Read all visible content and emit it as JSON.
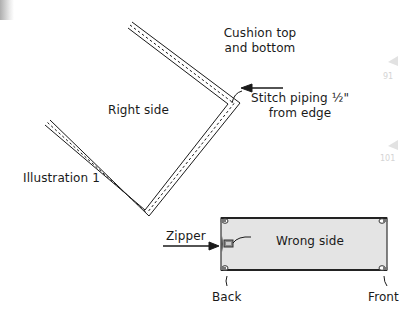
{
  "diagram": {
    "title": "Illustration 1",
    "labels": {
      "cushion": [
        "Cushion top",
        "and bottom"
      ],
      "right_side": "Right side",
      "stitch": [
        "Stitch piping ½\"",
        "from edge"
      ],
      "zipper": "Zipper",
      "wrong_side": "Wrong side",
      "back": "Back",
      "front": "Front"
    },
    "margin_marks": [
      "91",
      "101"
    ],
    "colors": {
      "line": "#1a1a1a",
      "panel_fill": "#e4e4e4",
      "background": "#ffffff"
    }
  }
}
